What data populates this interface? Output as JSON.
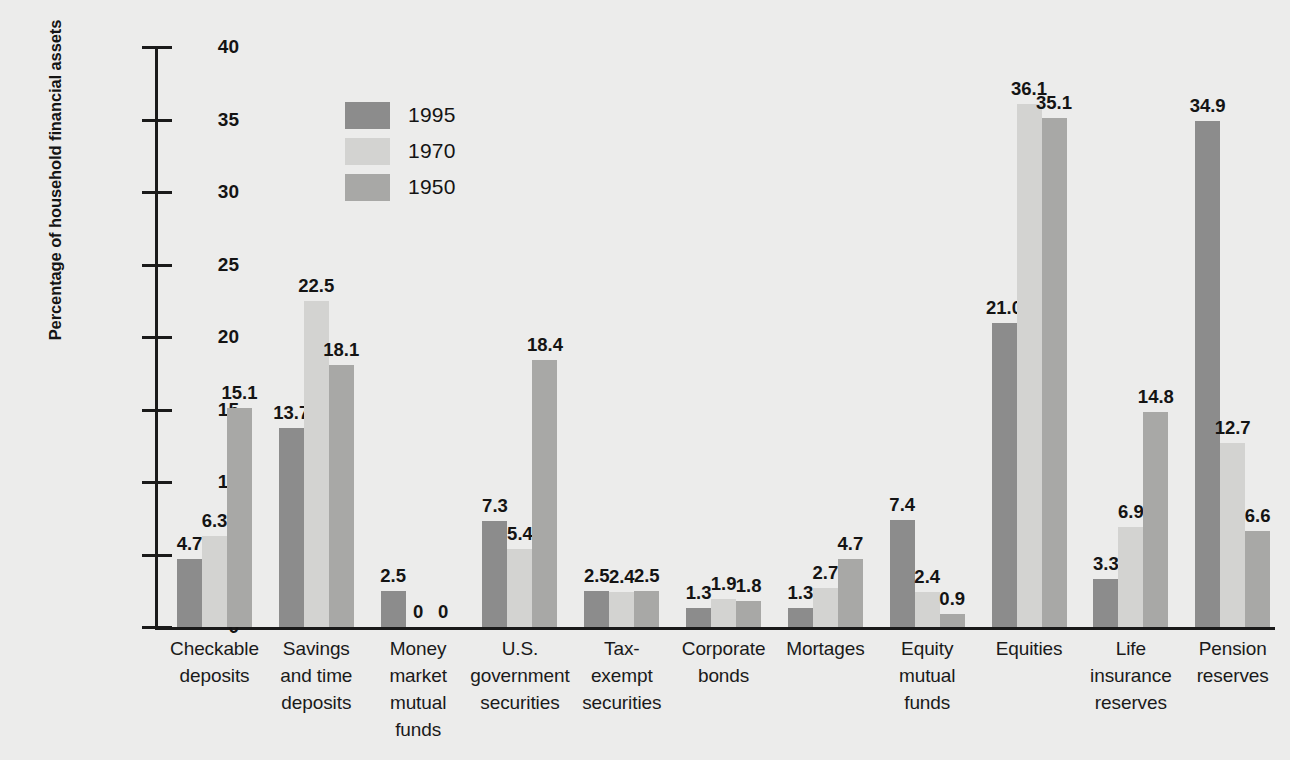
{
  "chart_data": {
    "type": "bar",
    "title": "",
    "subtitle": "",
    "xlabel": "",
    "ylabel": "Percentage of household financial assets",
    "ylim": [
      0,
      40
    ],
    "yticks": [
      0,
      5,
      10,
      15,
      20,
      25,
      30,
      35,
      40
    ],
    "ytick_labels": [
      "0",
      "5",
      "10",
      "15",
      "20",
      "25",
      "30",
      "35",
      "40"
    ],
    "grid": false,
    "legend_position": "upper-left-inside",
    "categories": [
      "Checkable deposits",
      "Savings and time deposits",
      "Money market mutual funds",
      "U.S. government securities",
      "Tax-exempt securities",
      "Corporate bonds",
      "Mortages",
      "Equity mutual funds",
      "Equities",
      "Life insurance reserves",
      "Pension reserves"
    ],
    "category_lines": [
      [
        "Checkable",
        "deposits"
      ],
      [
        "Savings",
        "and time",
        "deposits"
      ],
      [
        "Money",
        "market",
        "mutual",
        "funds"
      ],
      [
        "U.S.",
        "government",
        "securities"
      ],
      [
        "Tax-",
        "exempt",
        "securities"
      ],
      [
        "Corporate",
        "bonds"
      ],
      [
        "Mortages"
      ],
      [
        "Equity",
        "mutual",
        "funds"
      ],
      [
        "Equities"
      ],
      [
        "Life",
        "insurance",
        "reserves"
      ],
      [
        "Pension",
        "reserves"
      ]
    ],
    "series": [
      {
        "name": "1995",
        "color": "#8c8c8c",
        "values": [
          4.7,
          13.7,
          2.5,
          7.3,
          2.5,
          1.3,
          1.3,
          7.4,
          21.0,
          3.3,
          34.9
        ],
        "labels": [
          "4.7",
          "13.7",
          "2.5",
          "7.3",
          "2.5",
          "1.3",
          "1.3",
          "7.4",
          "21.0",
          "3.3",
          "34.9"
        ]
      },
      {
        "name": "1970",
        "color": "#d3d3d1",
        "values": [
          6.3,
          22.5,
          0,
          5.4,
          2.4,
          1.9,
          2.7,
          2.4,
          36.1,
          6.9,
          12.7
        ],
        "labels": [
          "6.3",
          "22.5",
          "0",
          "5.4",
          "2.4",
          "1.9",
          "2.7",
          "2.4",
          "36.1",
          "6.9",
          "12.7"
        ]
      },
      {
        "name": "1950",
        "color": "#a8a8a6",
        "values": [
          15.1,
          18.1,
          0,
          18.4,
          2.5,
          1.8,
          4.7,
          0.9,
          35.1,
          14.8,
          6.6
        ],
        "labels": [
          "15.1",
          "18.1",
          "0",
          "18.4",
          "2.5",
          "1.8",
          "4.7",
          "0.9",
          "35.1",
          "14.8",
          "6.6"
        ]
      }
    ]
  },
  "legend": {
    "entries": [
      {
        "label": "1995",
        "color": "#8c8c8c"
      },
      {
        "label": "1970",
        "color": "#d3d3d1"
      },
      {
        "label": "1950",
        "color": "#a8a8a6"
      }
    ]
  },
  "colors": {
    "background": "#ececeb",
    "axis": "#1a1a1a",
    "text": "#141414"
  }
}
